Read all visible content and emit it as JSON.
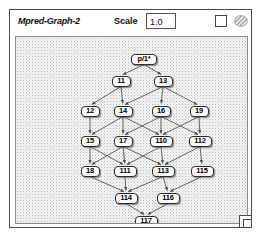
{
  "window": {
    "title": "Mpred-Graph-2"
  },
  "toolbar": {
    "scale_label": "Scale",
    "scale_value": "1.0",
    "checkbox_name": "display-toggle-checkbox",
    "hatch_icon_name": "hatched-pattern-icon"
  },
  "colors": {
    "window_border": "#4a4a4a",
    "canvas_bg": "#f3f3f3",
    "canvas_border": "#8a8a8a",
    "node_fill": "#fdfdfd",
    "node_border": "#2b2b2b",
    "edge": "#4c4c4c",
    "text": "#000000"
  },
  "graph": {
    "type": "directed-acyclic-graph",
    "node_count": 18,
    "edge_count": 29,
    "nodes": [
      {
        "id": "p1",
        "label": "p/1*",
        "x": 128,
        "y": 22,
        "w": 26,
        "h": 11
      },
      {
        "id": "n11",
        "label": "11",
        "x": 105,
        "y": 44,
        "w": 19,
        "h": 11
      },
      {
        "id": "n13",
        "label": "13",
        "x": 147,
        "y": 44,
        "w": 19,
        "h": 11
      },
      {
        "id": "n12",
        "label": "12",
        "x": 74,
        "y": 74,
        "w": 19,
        "h": 11
      },
      {
        "id": "n14",
        "label": "14",
        "x": 107,
        "y": 74,
        "w": 19,
        "h": 11
      },
      {
        "id": "n16",
        "label": "16",
        "x": 145,
        "y": 74,
        "w": 19,
        "h": 11
      },
      {
        "id": "n19",
        "label": "19",
        "x": 183,
        "y": 74,
        "w": 19,
        "h": 11
      },
      {
        "id": "n15",
        "label": "15",
        "x": 74,
        "y": 104,
        "w": 19,
        "h": 11
      },
      {
        "id": "n17",
        "label": "17",
        "x": 107,
        "y": 104,
        "w": 19,
        "h": 11
      },
      {
        "id": "n110",
        "label": "110",
        "x": 145,
        "y": 104,
        "w": 23,
        "h": 11
      },
      {
        "id": "n112",
        "label": "112",
        "x": 184,
        "y": 104,
        "w": 23,
        "h": 11
      },
      {
        "id": "n18",
        "label": "18",
        "x": 74,
        "y": 134,
        "w": 19,
        "h": 11
      },
      {
        "id": "n111",
        "label": "111",
        "x": 109,
        "y": 134,
        "w": 23,
        "h": 11
      },
      {
        "id": "n113",
        "label": "113",
        "x": 147,
        "y": 134,
        "w": 23,
        "h": 11
      },
      {
        "id": "n115",
        "label": "115",
        "x": 186,
        "y": 134,
        "w": 23,
        "h": 11
      },
      {
        "id": "n114",
        "label": "114",
        "x": 110,
        "y": 161,
        "w": 23,
        "h": 11
      },
      {
        "id": "n116",
        "label": "116",
        "x": 152,
        "y": 161,
        "w": 23,
        "h": 11
      },
      {
        "id": "n117",
        "label": "117",
        "x": 130,
        "y": 184,
        "w": 23,
        "h": 11
      }
    ],
    "edges": [
      {
        "from": "p1",
        "to": "n11"
      },
      {
        "from": "p1",
        "to": "n13"
      },
      {
        "from": "n11",
        "to": "n12"
      },
      {
        "from": "n11",
        "to": "n14"
      },
      {
        "from": "n13",
        "to": "n14"
      },
      {
        "from": "n13",
        "to": "n16"
      },
      {
        "from": "n13",
        "to": "n19"
      },
      {
        "from": "n12",
        "to": "n15"
      },
      {
        "from": "n14",
        "to": "n15"
      },
      {
        "from": "n14",
        "to": "n17"
      },
      {
        "from": "n14",
        "to": "n110"
      },
      {
        "from": "n16",
        "to": "n17"
      },
      {
        "from": "n16",
        "to": "n110"
      },
      {
        "from": "n16",
        "to": "n112"
      },
      {
        "from": "n19",
        "to": "n110"
      },
      {
        "from": "n19",
        "to": "n112"
      },
      {
        "from": "n15",
        "to": "n18"
      },
      {
        "from": "n15",
        "to": "n111"
      },
      {
        "from": "n17",
        "to": "n18"
      },
      {
        "from": "n17",
        "to": "n111"
      },
      {
        "from": "n17",
        "to": "n113"
      },
      {
        "from": "n110",
        "to": "n111"
      },
      {
        "from": "n110",
        "to": "n113"
      },
      {
        "from": "n112",
        "to": "n113"
      },
      {
        "from": "n112",
        "to": "n115"
      },
      {
        "from": "n18",
        "to": "n114"
      },
      {
        "from": "n111",
        "to": "n114"
      },
      {
        "from": "n113",
        "to": "n114"
      },
      {
        "from": "n113",
        "to": "n116"
      },
      {
        "from": "n115",
        "to": "n116"
      },
      {
        "from": "n114",
        "to": "n117"
      },
      {
        "from": "n116",
        "to": "n117"
      }
    ]
  }
}
